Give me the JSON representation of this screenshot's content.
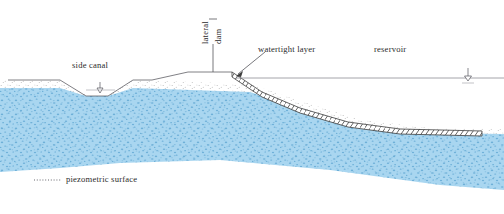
{
  "figure": {
    "type": "cross-section-diagram",
    "width": 504,
    "height": 214
  },
  "labels": {
    "side_canal": "side canal",
    "lateral": "lateral",
    "dam": "dam",
    "watertight_layer": "watertight layer",
    "reservoir": "reservoir",
    "piezometric_surface": "piezometric surface"
  },
  "colors": {
    "water_fill": "#a9d6f0",
    "water_speckle": "#5ba3d0",
    "line": "#55555c",
    "hatch": "#3d3d3d",
    "text": "#2b2b2b",
    "ground_stipple": "#8a8a8a"
  },
  "geometry": {
    "ground_line_left_y": 80,
    "reservoir_surface_y": 78,
    "dam_crest_y": 72,
    "dam_crest_x_start": 188,
    "dam_crest_x_end": 232,
    "canal_bottom_y": 96,
    "watertight_layer_end_x": 482
  },
  "markers": {
    "canal_water_level": "water-level-triangle",
    "reservoir_water_level": "water-level-triangle"
  },
  "legend": {
    "piezometric_line_style": "dotted"
  }
}
